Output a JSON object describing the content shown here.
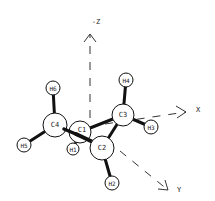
{
  "diagram": {
    "type": "molecular-structure",
    "axes": {
      "z": {
        "label": "-Z"
      },
      "x": {
        "label": "X"
      },
      "y": {
        "label": "Y"
      }
    },
    "atoms": [
      {
        "id": "C1",
        "label": "C1",
        "element": "C"
      },
      {
        "id": "C2",
        "label": "C2",
        "element": "C"
      },
      {
        "id": "C3",
        "label": "C3",
        "element": "C"
      },
      {
        "id": "C4",
        "label": "C4",
        "element": "C"
      },
      {
        "id": "H1",
        "label": "H1",
        "element": "H"
      },
      {
        "id": "H2",
        "label": "H2",
        "element": "H"
      },
      {
        "id": "H3",
        "label": "H3",
        "element": "H"
      },
      {
        "id": "H4",
        "label": "H4",
        "element": "H"
      },
      {
        "id": "H5",
        "label": "H5",
        "element": "H"
      },
      {
        "id": "H6",
        "label": "H6",
        "element": "H"
      }
    ],
    "bonds": [
      [
        "C1",
        "C2"
      ],
      [
        "C1",
        "C3"
      ],
      [
        "C1",
        "C4"
      ],
      [
        "C1",
        "H1"
      ],
      [
        "C2",
        "C3"
      ],
      [
        "C2",
        "H2"
      ],
      [
        "C3",
        "H3"
      ],
      [
        "C3",
        "H4"
      ],
      [
        "C4",
        "H5"
      ],
      [
        "C4",
        "H6"
      ]
    ],
    "colors": {
      "line": "#111111",
      "atom_fill": "#ffffff",
      "text": "#222222"
    }
  }
}
